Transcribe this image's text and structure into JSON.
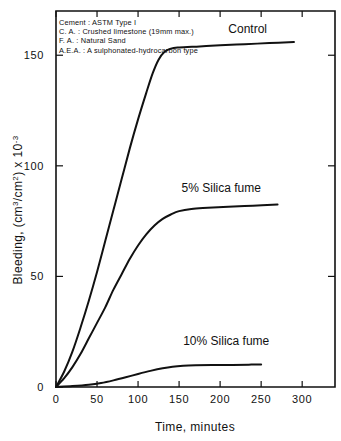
{
  "chart_data": {
    "type": "line",
    "title": "",
    "xlabel": "Time, minutes",
    "ylabel": "Bleeding, (cm3/cm2) x 10-3",
    "ylabel_parts": {
      "prefix": "Bleeding, (cm",
      "sup1": "3",
      "mid": "/cm",
      "sup2": "2",
      "suffix": ") x 10",
      "sup3": "-3"
    },
    "xlim": [
      0,
      340
    ],
    "ylim": [
      0,
      170
    ],
    "xticks": [
      0,
      50,
      100,
      150,
      200,
      250,
      300
    ],
    "yticks": [
      0,
      50,
      100,
      150
    ],
    "xtick_labels": [
      "0",
      "50",
      "100",
      "150",
      "200",
      "250",
      "300"
    ],
    "ytick_labels": [
      "0",
      "50",
      "100",
      "150"
    ],
    "grid": false,
    "legend_position": "inline-annotations",
    "series": [
      {
        "name": "Control",
        "label": "Control",
        "label_x": 210,
        "label_y": 160,
        "points": [
          [
            0,
            0
          ],
          [
            10,
            7
          ],
          [
            20,
            16
          ],
          [
            30,
            27
          ],
          [
            40,
            39
          ],
          [
            50,
            52
          ],
          [
            60,
            66
          ],
          [
            70,
            80
          ],
          [
            80,
            94
          ],
          [
            90,
            108
          ],
          [
            100,
            121
          ],
          [
            110,
            133
          ],
          [
            118,
            142
          ],
          [
            125,
            148
          ],
          [
            132,
            151.5
          ],
          [
            140,
            153
          ],
          [
            150,
            153.5
          ],
          [
            175,
            154
          ],
          [
            200,
            154.5
          ],
          [
            230,
            155
          ],
          [
            260,
            155.5
          ],
          [
            290,
            156
          ]
        ]
      },
      {
        "name": "5% Silica fume",
        "label": "5% Silica fume",
        "label_x": 153,
        "label_y": 88,
        "points": [
          [
            0,
            0
          ],
          [
            10,
            4
          ],
          [
            20,
            9
          ],
          [
            30,
            15
          ],
          [
            40,
            22
          ],
          [
            50,
            29
          ],
          [
            60,
            36
          ],
          [
            70,
            44
          ],
          [
            80,
            51
          ],
          [
            90,
            58
          ],
          [
            100,
            64
          ],
          [
            110,
            69
          ],
          [
            120,
            73
          ],
          [
            130,
            76
          ],
          [
            140,
            78
          ],
          [
            150,
            79.5
          ],
          [
            165,
            80.5
          ],
          [
            185,
            81
          ],
          [
            210,
            81.5
          ],
          [
            240,
            82
          ],
          [
            270,
            82.5
          ]
        ]
      },
      {
        "name": "10% Silica fume",
        "label": "10% Silica fume",
        "label_x": 155,
        "label_y": 19,
        "points": [
          [
            0,
            0
          ],
          [
            20,
            0.4
          ],
          [
            40,
            1.0
          ],
          [
            55,
            1.8
          ],
          [
            70,
            3.0
          ],
          [
            85,
            4.4
          ],
          [
            100,
            5.9
          ],
          [
            115,
            7.3
          ],
          [
            130,
            8.5
          ],
          [
            142,
            9.2
          ],
          [
            155,
            9.6
          ],
          [
            170,
            9.8
          ],
          [
            190,
            9.9
          ],
          [
            215,
            10.0
          ],
          [
            235,
            10.1
          ],
          [
            250,
            10.2
          ]
        ]
      }
    ],
    "annotations": [
      "Cement :  ASTM Type I",
      "C. A. : Crushed limestone  (19mm max.)",
      "F. A. :  Natural Sand",
      "A.E.A. :  A sulphonated-hydrocarbon type"
    ]
  },
  "colors": {
    "ink": "#111111",
    "background": "#ffffff"
  }
}
